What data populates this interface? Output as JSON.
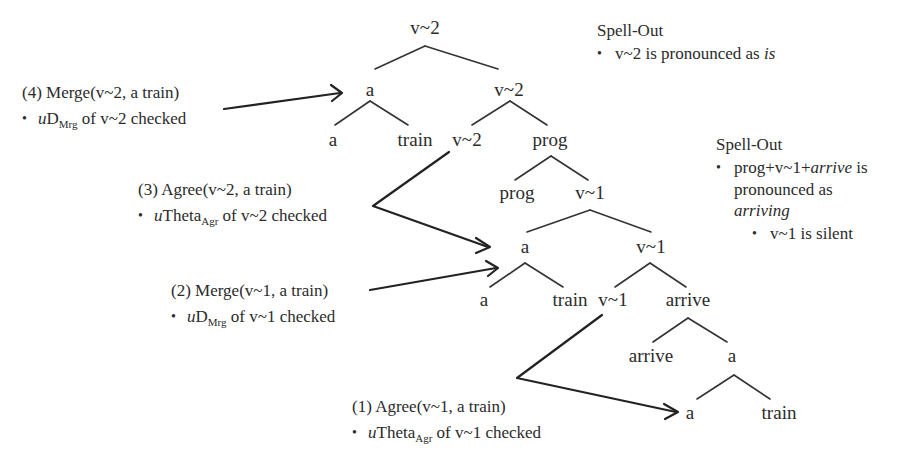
{
  "tree": {
    "nodes": {
      "root_v2": "v~2",
      "spec_a_top": "a",
      "bar_v2": "v~2",
      "a_top_left": "a",
      "train_top": "train",
      "head_v2": "v~2",
      "prog_phrase": "prog",
      "prog_head": "prog",
      "v1_phrase": "v~1",
      "spec_a_mid": "a",
      "bar_v1": "v~1",
      "a_mid_left": "a",
      "train_mid": "train",
      "head_v1": "v~1",
      "arrive_phrase": "arrive",
      "arrive_head": "arrive",
      "a_low_phrase": "a",
      "a_bottom": "a",
      "train_bottom": "train"
    }
  },
  "annotations": {
    "step4": {
      "title": "(4) Merge(v~2, a train)",
      "bullet_prefix": "u",
      "bullet_main": "D",
      "bullet_sub": "Mrg",
      "bullet_rest": " of v~2 checked"
    },
    "step3": {
      "title": "(3) Agree(v~2, a train)",
      "bullet_prefix": "u",
      "bullet_main": "Theta",
      "bullet_sub": "Agr",
      "bullet_rest": " of v~2 checked"
    },
    "step2": {
      "title": "(2) Merge(v~1, a train)",
      "bullet_prefix": "u",
      "bullet_main": "D",
      "bullet_sub": "Mrg",
      "bullet_rest": " of v~1 checked"
    },
    "step1": {
      "title": "(1) Agree(v~1, a train)",
      "bullet_prefix": "u",
      "bullet_main": "Theta",
      "bullet_sub": "Agr",
      "bullet_rest": " of v~1 checked"
    }
  },
  "spellout": {
    "top": {
      "title": "Spell-Out",
      "bullet_text": "v~2 is pronounced as ",
      "bullet_italic": "is"
    },
    "mid": {
      "title": "Spell-Out",
      "bullet_line1_prefix": "prog+v~1+",
      "bullet_line1_italic": "arrive",
      "bullet_line1_suffix": " is",
      "bullet_line2": "pronounced as",
      "bullet_line3_italic": "arriving",
      "sub_bullet": "v~1 is silent"
    }
  },
  "colors": {
    "text": "#2b2b2b",
    "line": "#333333",
    "background": "#ffffff"
  }
}
